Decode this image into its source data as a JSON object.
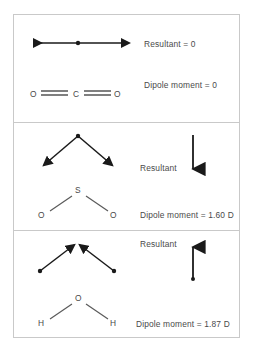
{
  "figure": {
    "title": "",
    "panels": [
      {
        "id": "co2",
        "molecule": {
          "name": "carbon-dioxide",
          "atoms": [
            "O",
            "C",
            "O"
          ],
          "geometry": "linear",
          "bond": "double"
        },
        "bond_vectors": {
          "description": "two equal and opposite horizontal bond dipoles",
          "count": 2,
          "direction": "opposed-horizontal"
        },
        "resultant_label": "Resultant  =  0",
        "resultant_vector": "none",
        "dipole_label": "Dipole moment  =  0",
        "dipole_value": "0"
      },
      {
        "id": "so2",
        "molecule": {
          "name": "sulfur-dioxide",
          "atoms": [
            "O",
            "S",
            "O"
          ],
          "geometry": "bent",
          "bond": "single"
        },
        "bond_vectors": {
          "description": "two bond dipoles pointing down and outward from apex",
          "count": 2,
          "direction": "down-outward"
        },
        "resultant_label": "Resultant",
        "resultant_vector": "down",
        "dipole_label": "Dipole moment  =  1.60 D",
        "dipole_value": "1.60 D"
      },
      {
        "id": "water",
        "molecule": {
          "name": "water",
          "atoms": [
            "H",
            "O",
            "H"
          ],
          "geometry": "bent",
          "bond": "single"
        },
        "bond_vectors": {
          "description": "two bond dipoles pointing up and inward toward apex",
          "count": 2,
          "direction": "up-inward"
        },
        "resultant_label": "Resultant",
        "resultant_vector": "up",
        "dipole_label": "Dipole moment  =  1.87 D",
        "dipole_value": "1.87 D"
      }
    ]
  },
  "atom_labels": {
    "co2_left": "O",
    "co2_center": "C",
    "co2_right": "O",
    "so2_apex": "S",
    "so2_left": "O",
    "so2_right": "O",
    "water_apex": "O",
    "water_left": "H",
    "water_right": "H"
  },
  "colors": {
    "frame": "#c9c9c9",
    "text": "#4a4a4a",
    "vector": "#1a1a1a",
    "bond": "#5a5a5a",
    "background": "#ffffff"
  }
}
